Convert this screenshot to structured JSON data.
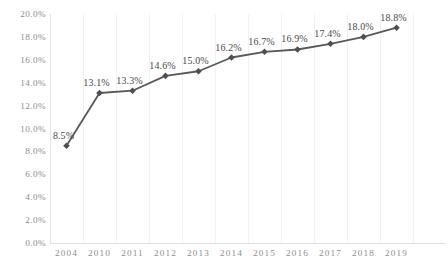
{
  "chart_data": {
    "type": "line",
    "title": "",
    "subtitle": "",
    "xlabel": "",
    "ylabel": "",
    "categories": [
      "2004",
      "2010",
      "2011",
      "2012",
      "2013",
      "2014",
      "2015",
      "2016",
      "2017",
      "2018",
      "2019"
    ],
    "values": [
      8.5,
      13.1,
      13.3,
      14.6,
      15.0,
      16.2,
      16.7,
      16.9,
      17.4,
      18.0,
      18.8
    ],
    "point_labels": [
      "8.5%",
      "13.1%",
      "13.3%",
      "14.6%",
      "15.0%",
      "16.2%",
      "16.7%",
      "16.9%",
      "17.4%",
      "18.0%",
      "18.8%"
    ],
    "ylim": [
      0,
      20
    ],
    "ytick_values": [
      0,
      2,
      4,
      6,
      8,
      10,
      12,
      14,
      16,
      18,
      20
    ],
    "ytick_labels": [
      "0.0%",
      "2.0%",
      "4.0%",
      "6.0%",
      "8.0%",
      "10.0%",
      "12.0%",
      "14.0%",
      "16.0%",
      "18.0%",
      "20.0%"
    ],
    "grid": {
      "vertical": true,
      "horizontal": false
    },
    "legend": {
      "visible": false,
      "position": "none"
    },
    "series": [
      {
        "name": "",
        "values": [
          8.5,
          13.1,
          13.3,
          14.6,
          15.0,
          16.2,
          16.7,
          16.9,
          17.4,
          18.0,
          18.8
        ]
      }
    ],
    "colors": {
      "line": "#595959",
      "marker": "#4f4f4f",
      "data_label_text": "#4a4a4a",
      "tick_text": "#8d8d8d",
      "gridline": "#f2f2f2",
      "axis": "#e0e0e0",
      "background": "#ffffff"
    },
    "marker_shape": "diamond"
  }
}
